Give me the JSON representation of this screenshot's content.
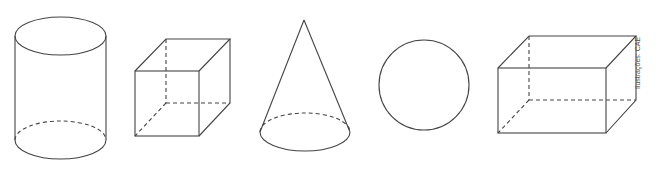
{
  "figure": {
    "shapes": [
      {
        "name": "cylinder"
      },
      {
        "name": "cube"
      },
      {
        "name": "cone"
      },
      {
        "name": "sphere"
      },
      {
        "name": "rectangular-prism"
      }
    ],
    "credit": "Ilustrações: CAE",
    "stroke_color": "#444444"
  }
}
